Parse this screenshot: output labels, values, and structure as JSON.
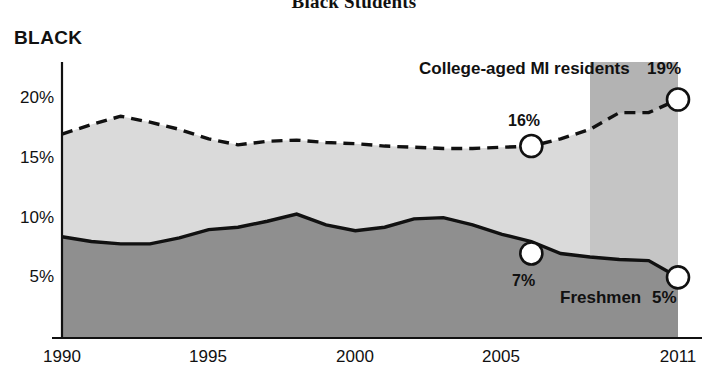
{
  "title": "Black Students",
  "series_label": "BLACK",
  "annotations": {
    "upper_series": "College-aged MI residents",
    "upper_value": "19%",
    "mid_value": "16%",
    "lower_value": "7%",
    "lower_series": "Freshmen",
    "lower_series_value": "5%"
  },
  "colors": {
    "upper_area": "#cccccc",
    "lower_area": "#8f8f8f",
    "highlight_band": "#b3b3b3",
    "line": "#111111",
    "axis": "#111111",
    "marker_fill": "#ffffff"
  },
  "chart_data": {
    "type": "area",
    "title": "Black Students",
    "subtitle": "BLACK",
    "xlabel": "",
    "ylabel": "",
    "xlim": [
      1990,
      2011
    ],
    "ylim": [
      0,
      22
    ],
    "grid": false,
    "legend_position": "inline-annotations",
    "x_tick_labels": [
      "1990",
      "1995",
      "2000",
      "2005",
      "2011"
    ],
    "x_ticks": [
      1990,
      1995,
      2000,
      2005,
      2011
    ],
    "y_tick_labels": [
      "5%",
      "10%",
      "15%",
      "20%"
    ],
    "y_ticks": [
      5,
      10,
      15,
      20
    ],
    "highlight_band": {
      "start": 2008,
      "end": 2011
    },
    "x": [
      1990,
      1991,
      1992,
      1993,
      1994,
      1995,
      1996,
      1997,
      1998,
      1999,
      2000,
      2001,
      2002,
      2003,
      2004,
      2005,
      2006,
      2007,
      2008,
      2009,
      2010,
      2011
    ],
    "series": [
      {
        "name": "College-aged MI residents",
        "style": "dashed",
        "values": [
          17.0,
          17.8,
          18.5,
          18.0,
          17.4,
          16.6,
          16.1,
          16.4,
          16.5,
          16.3,
          16.2,
          16.0,
          15.9,
          15.8,
          15.8,
          15.9,
          16.0,
          16.6,
          17.4,
          18.8,
          18.8,
          19.9
        ],
        "labeled_points": [
          {
            "x": 2006,
            "y": 16.0,
            "label": "16%"
          },
          {
            "x": 2011,
            "y": 19.9,
            "label": "19%"
          }
        ]
      },
      {
        "name": "Freshmen",
        "style": "solid",
        "values": [
          8.4,
          8.0,
          7.8,
          7.8,
          8.3,
          9.0,
          9.2,
          9.7,
          10.3,
          9.4,
          8.9,
          9.2,
          9.9,
          10.0,
          9.4,
          8.6,
          8.0,
          7.0,
          6.7,
          6.5,
          6.4,
          5.0
        ],
        "labeled_points": [
          {
            "x": 2006,
            "y": 7.0,
            "label": "7%"
          },
          {
            "x": 2011,
            "y": 5.0,
            "label": "5%"
          }
        ]
      }
    ]
  }
}
